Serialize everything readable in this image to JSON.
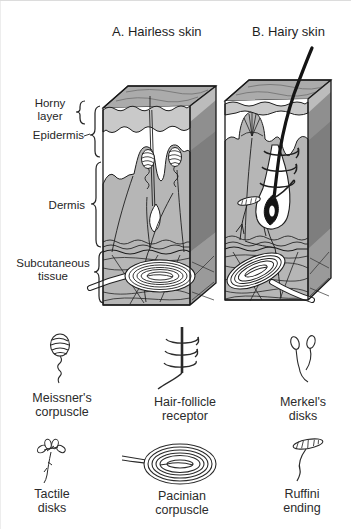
{
  "figure": {
    "panel_a_title": "A. Hairless skin",
    "panel_b_title": "B. Hairy skin"
  },
  "layer_labels": {
    "horny": "Horny\nlayer",
    "epidermis": "Epidermis",
    "dermis": "Dermis",
    "subcutaneous": "Subcutaneous\ntissue"
  },
  "receptors": [
    {
      "id": "meissner",
      "name": "Meissner's\ncorpuscle"
    },
    {
      "id": "hair-follicle",
      "name": "Hair-follicle\nreceptor"
    },
    {
      "id": "merkel",
      "name": "Merkel's\ndisks"
    },
    {
      "id": "tactile",
      "name": "Tactile\ndisks"
    },
    {
      "id": "pacinian",
      "name": "Pacinian\ncorpuscle"
    },
    {
      "id": "ruffini",
      "name": "Ruffini\nending"
    }
  ],
  "colors": {
    "line": "#1f1f1f",
    "hair": "#141414",
    "top_face": "#ababab",
    "side_face": "#8f8f8f",
    "side_face_dermis": "#7e7e7e",
    "side_face_subcutaneous": "#989898",
    "horny_layer": "#c9c9c9",
    "dermis": "#b6b6b6",
    "epidermis": "#ffffff",
    "background": "#ffffff",
    "text": "#262626"
  }
}
